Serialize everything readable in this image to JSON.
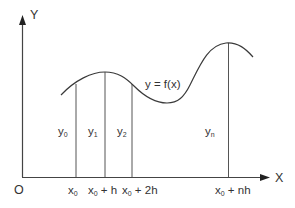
{
  "diagram": {
    "colors": {
      "ink": "#333333",
      "curve": "#3a3a3a",
      "background": "#ffffff"
    },
    "axes": {
      "x_label": "X",
      "y_label": "Y",
      "origin_label": "O"
    },
    "curve_label": "y = f(x)",
    "ordinates": [
      {
        "y_base": "y",
        "y_sub": "0",
        "x_base": "x",
        "x_sub": "0",
        "x_suffix": ""
      },
      {
        "y_base": "y",
        "y_sub": "1",
        "x_base": "x",
        "x_sub": "0",
        "x_suffix": " + h"
      },
      {
        "y_base": "y",
        "y_sub": "2",
        "x_base": "x",
        "x_sub": "0",
        "x_suffix": " + 2h"
      },
      {
        "y_base": "y",
        "y_sub": "n",
        "x_base": "x",
        "x_sub": "0",
        "x_suffix": " + nh"
      }
    ]
  }
}
